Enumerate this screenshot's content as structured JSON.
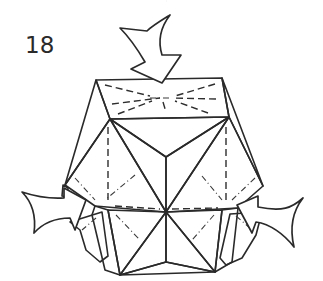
{
  "diagram": {
    "step_number": "18",
    "colors": {
      "paper_light": "#b4b4b4",
      "paper_mid": "#9c9c9c",
      "paper_dark": "#7f7f7f",
      "line": "#2a2a2a",
      "arrow_fill": "#ffffff",
      "background": "#ffffff"
    },
    "arrows": [
      {
        "id": "top",
        "direction": "down",
        "meaning": "push in"
      },
      {
        "id": "left",
        "direction": "right",
        "meaning": "push in"
      },
      {
        "id": "right",
        "direction": "left",
        "meaning": "push in"
      }
    ],
    "fold_lines": [
      "valley",
      "mountain"
    ]
  }
}
